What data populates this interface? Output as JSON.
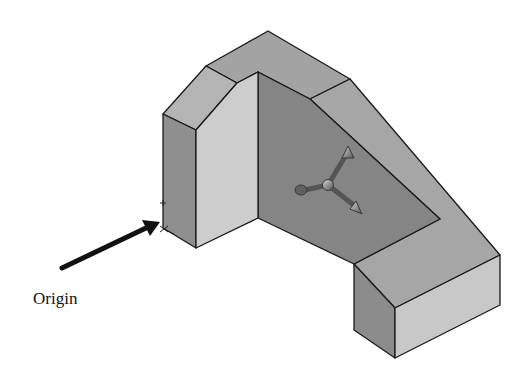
{
  "figure": {
    "annotation": {
      "label": "Origin",
      "label_pos": {
        "x": 33,
        "y": 289
      },
      "arrow": {
        "from": [
          62,
          268
        ],
        "to": [
          160,
          222
        ]
      }
    },
    "colors": {
      "outline": "#1a1a1a",
      "top_face": "#a3a3a3",
      "slope_face": "#b4b4b4",
      "left_side": "#8f8f8f",
      "front_light": "#cdcdcd",
      "inner_wall": "#858585",
      "right_top": "#9e9e9e",
      "right_front": "#c8c8c8",
      "right_side": "#8c8c8c",
      "triad": "#6a6a6a"
    },
    "part": "L-shaped bracket solid with angled chamfer faces, isometric view",
    "manipulator": "triad-move-handle"
  }
}
